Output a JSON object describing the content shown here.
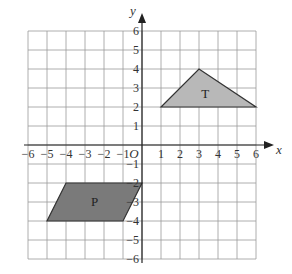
{
  "diagram": {
    "type": "coordinate-grid",
    "x_range": [
      -6,
      6
    ],
    "y_range": [
      -6,
      6
    ],
    "axis_labels": {
      "x": "x",
      "y": "y",
      "origin": "O"
    },
    "x_ticks": [
      "-6",
      "-5",
      "-4",
      "-3",
      "-2",
      "-1",
      "1",
      "2",
      "3",
      "4",
      "5",
      "6"
    ],
    "y_ticks": [
      "6",
      "5",
      "4",
      "3",
      "2",
      "1",
      "-1",
      "-2",
      "-3",
      "-4",
      "-5",
      "-6"
    ],
    "shapes": [
      {
        "label": "T",
        "kind": "triangle",
        "vertices": [
          [
            1,
            2
          ],
          [
            3,
            4
          ],
          [
            6,
            2
          ]
        ],
        "fill": "#b8b8b8"
      },
      {
        "label": "P",
        "kind": "parallelogram",
        "vertices": [
          [
            -4,
            -2
          ],
          [
            0,
            -2
          ],
          [
            -1,
            -4
          ],
          [
            -5,
            -4
          ]
        ],
        "fill": "#7a7a7a"
      }
    ],
    "colors": {
      "grid": "#9a9a9a",
      "axis": "#222222",
      "stroke": "#333333"
    }
  }
}
